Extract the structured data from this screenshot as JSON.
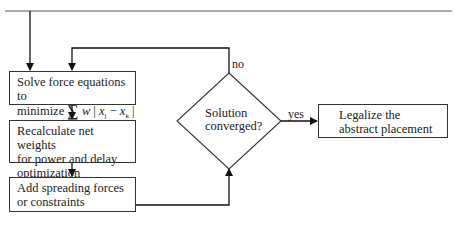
{
  "diagram": {
    "type": "flowchart",
    "nodes": {
      "solve": {
        "line1": "Solve force equations to",
        "line2_prefix": "minimize ",
        "formula": {
          "sigma": "∑",
          "w": "w",
          "bar1": "|",
          "x1": "x",
          "sub1": "j",
          "minus": " − ",
          "x2": "x",
          "sub2": "k",
          "bar2": "|"
        }
      },
      "recalculate": {
        "line1": "Recalculate net weights",
        "line2": "for power and delay",
        "line3": "optimization"
      },
      "spreading": {
        "line1": "Add spreading forces",
        "line2": "or constraints"
      },
      "decision": {
        "line1": "Solution",
        "line2": "converged?"
      },
      "legalize": {
        "line1": "Legalize the",
        "line2": "abstract placement"
      }
    },
    "edge_labels": {
      "no": "no",
      "yes": "yes"
    },
    "edges": [
      {
        "from": "start",
        "to": "solve"
      },
      {
        "from": "solve",
        "to": "recalculate"
      },
      {
        "from": "recalculate",
        "to": "spreading"
      },
      {
        "from": "spreading",
        "to": "decision"
      },
      {
        "from": "decision",
        "to": "solve",
        "label": "no"
      },
      {
        "from": "decision",
        "to": "legalize",
        "label": "yes"
      }
    ]
  }
}
